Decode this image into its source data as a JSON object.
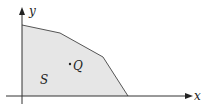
{
  "diagram": {
    "axes": {
      "x_label": "x",
      "y_label": "y"
    },
    "region": {
      "label": "S",
      "fill": "#e6e6e6",
      "stroke": "#555555",
      "vertices": [
        [
          22,
          25
        ],
        [
          60,
          33
        ],
        [
          103,
          57
        ],
        [
          128,
          96
        ],
        [
          22,
          96
        ]
      ]
    },
    "point": {
      "label": "Q",
      "marker": "•"
    }
  }
}
